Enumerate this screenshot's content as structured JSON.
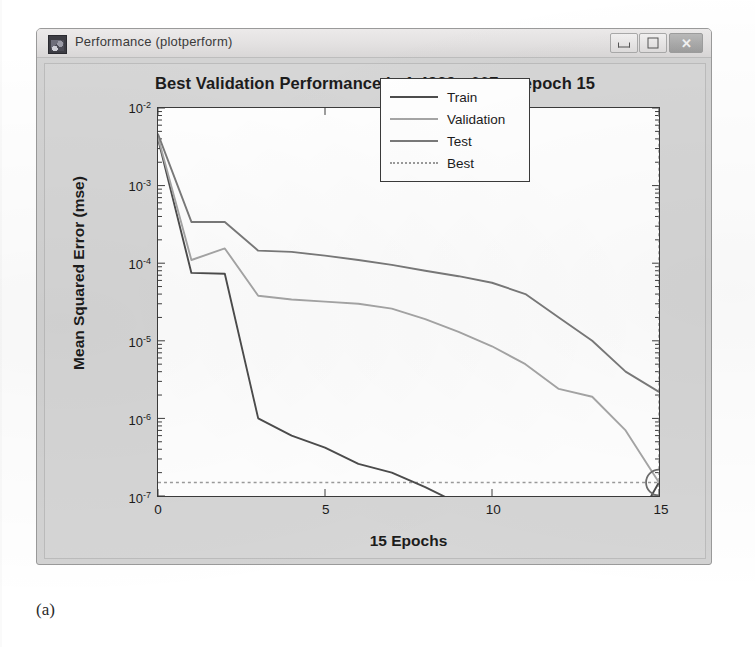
{
  "window": {
    "title": "Performance (plotperform)",
    "icon": "matlab-figure-icon",
    "controls": {
      "minimize": "–",
      "maximize": "□",
      "close": "✕"
    }
  },
  "figure": {
    "title": "Best Validation Performance is 1.4939e-007 at epoch 15",
    "caption": "(a)"
  },
  "legend": {
    "items": [
      {
        "label": "Train",
        "color": "#4d4d4d",
        "style": "solid"
      },
      {
        "label": "Validation",
        "color": "#a6a6a6",
        "style": "solid"
      },
      {
        "label": "Test",
        "color": "#7a7a7a",
        "style": "solid"
      },
      {
        "label": "Best",
        "color": "#9b9b9b",
        "style": "dotted"
      }
    ]
  },
  "chart_data": {
    "type": "line",
    "title": "Best Validation Performance is 1.4939e-007 at epoch 15",
    "xlabel": "15 Epochs",
    "ylabel": "Mean Squared Error  (mse)",
    "yscale": "log",
    "xlim": [
      0,
      15
    ],
    "ylim": [
      1e-07,
      0.01
    ],
    "grid": false,
    "legend_position": "top-right",
    "xticks": [
      "0",
      "5",
      "10",
      "15"
    ],
    "xtick_values": [
      0,
      5,
      10,
      15
    ],
    "yticks": [
      "10^-2",
      "10^-3",
      "10^-4",
      "10^-5",
      "10^-6",
      "10^-7"
    ],
    "ytick_values": [
      0.01,
      0.001,
      0.0001,
      1e-05,
      1e-06,
      1e-07
    ],
    "x": [
      0,
      1,
      2,
      3,
      4,
      5,
      6,
      7,
      8,
      9,
      10,
      11,
      12,
      13,
      14,
      15
    ],
    "series": [
      {
        "name": "Train",
        "color": "#4d4d4d",
        "style": "solid",
        "values": [
          0.004,
          7.5e-05,
          7.3e-05,
          1e-06,
          6e-07,
          4.2e-07,
          2.6e-07,
          2e-07,
          1.3e-07,
          8e-08,
          5.5e-08,
          4.6e-08,
          4.4e-08,
          4.5e-08,
          2.6e-08,
          1.5e-07
        ]
      },
      {
        "name": "Validation",
        "color": "#a6a6a6",
        "style": "solid",
        "values": [
          0.0042,
          0.00011,
          0.000155,
          3.8e-05,
          3.4e-05,
          3.2e-05,
          3e-05,
          2.6e-05,
          1.9e-05,
          1.3e-05,
          8.5e-06,
          5e-06,
          2.4e-06,
          1.9e-06,
          7e-07,
          1.4939e-07
        ]
      },
      {
        "name": "Test",
        "color": "#7a7a7a",
        "style": "solid",
        "values": [
          0.0046,
          0.00034,
          0.00034,
          0.000145,
          0.00014,
          0.000125,
          0.00011,
          9.5e-05,
          8e-05,
          6.8e-05,
          5.6e-05,
          4e-05,
          2e-05,
          1e-05,
          4e-06,
          2.2e-06
        ]
      }
    ],
    "best": {
      "name": "Best",
      "color": "#9b9b9b",
      "style": "dotted",
      "epoch": 15,
      "value": 1.4939e-07,
      "marker": "circle",
      "horizontal_line": true,
      "vertical_line": true
    }
  }
}
